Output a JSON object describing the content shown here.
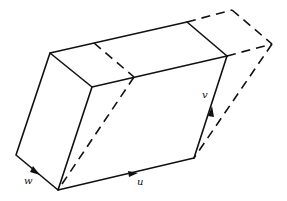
{
  "diagram": {
    "type": "parallelepiped-shear",
    "labels": {
      "u": "u",
      "v": "v",
      "w": "w"
    },
    "colors": {
      "line": "#111111",
      "background": "#ffffff"
    }
  }
}
